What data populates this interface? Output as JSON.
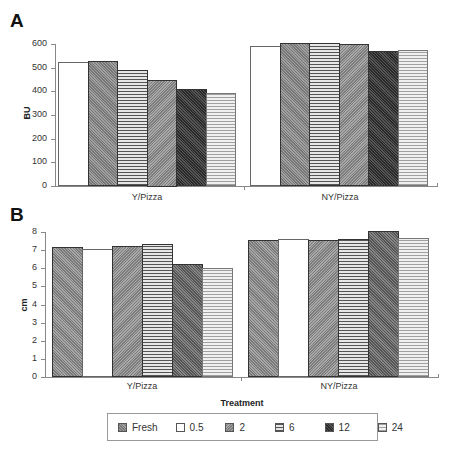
{
  "panels": {
    "a": {
      "label": "A",
      "ylabel": "BU",
      "yticks": [
        "0",
        "100",
        "200",
        "300",
        "400",
        "500",
        "600"
      ]
    },
    "b": {
      "label": "B",
      "ylabel": "cm",
      "yticks": [
        "0",
        "1",
        "2",
        "3",
        "4",
        "5",
        "6",
        "7",
        "8"
      ],
      "xlabel": "Treatment"
    }
  },
  "categories": [
    "Y/Pizza",
    "NY/Pizza"
  ],
  "legend": [
    {
      "key": "fresh",
      "label": "Fresh"
    },
    {
      "key": "05",
      "label": "0.5"
    },
    {
      "key": "2",
      "label": "2"
    },
    {
      "key": "6",
      "label": "6"
    },
    {
      "key": "12",
      "label": "12"
    },
    {
      "key": "24",
      "label": "24"
    }
  ],
  "chart_data": [
    {
      "type": "bar",
      "title": "A",
      "xlabel": "",
      "ylabel": "BU",
      "ylim": [
        0,
        600
      ],
      "yticks": [
        0,
        100,
        200,
        300,
        400,
        500,
        600
      ],
      "categories": [
        "Y/Pizza",
        "NY/Pizza"
      ],
      "series": [
        {
          "name": "0.5",
          "values": [
            525,
            590
          ]
        },
        {
          "name": "Fresh",
          "values": [
            530,
            605
          ]
        },
        {
          "name": "6",
          "values": [
            490,
            605
          ]
        },
        {
          "name": "2",
          "values": [
            450,
            600
          ]
        },
        {
          "name": "12",
          "values": [
            410,
            570
          ]
        },
        {
          "name": "24",
          "values": [
            395,
            575
          ]
        }
      ],
      "legend_position": "bottom",
      "grid": false
    },
    {
      "type": "bar",
      "title": "B",
      "xlabel": "Treatment",
      "ylabel": "cm",
      "ylim": [
        0,
        8
      ],
      "yticks": [
        0,
        1,
        2,
        3,
        4,
        5,
        6,
        7,
        8
      ],
      "categories": [
        "Y/Pizza",
        "NY/Pizza"
      ],
      "series": [
        {
          "name": "Fresh",
          "values": [
            7.15,
            7.55
          ]
        },
        {
          "name": "0.5",
          "values": [
            7.07,
            7.62
          ]
        },
        {
          "name": "2",
          "values": [
            7.22,
            7.55
          ]
        },
        {
          "name": "6",
          "values": [
            7.33,
            7.61
          ]
        },
        {
          "name": "12",
          "values": [
            6.26,
            8.03
          ]
        },
        {
          "name": "24",
          "values": [
            6.04,
            7.65
          ]
        }
      ],
      "legend_position": "bottom",
      "grid": false
    }
  ]
}
